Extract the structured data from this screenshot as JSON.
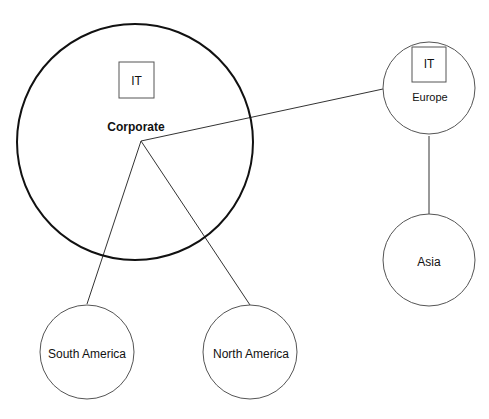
{
  "diagram": {
    "nodes": {
      "corporate": {
        "label": "Corporate",
        "sublabel": "IT"
      },
      "europe": {
        "label": "Europe",
        "sublabel": "IT"
      },
      "asia": {
        "label": "Asia"
      },
      "south_america": {
        "label": "South America"
      },
      "north_america": {
        "label": "North America"
      }
    },
    "edges": [
      {
        "from": "corporate",
        "to": "europe"
      },
      {
        "from": "corporate",
        "to": "south_america"
      },
      {
        "from": "corporate",
        "to": "north_america"
      },
      {
        "from": "europe",
        "to": "asia"
      }
    ]
  }
}
